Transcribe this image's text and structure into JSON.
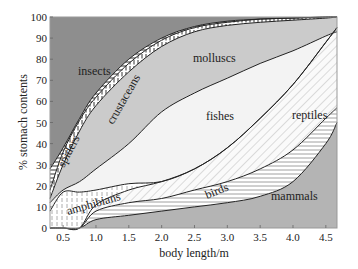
{
  "chart_data": {
    "type": "area",
    "title": "",
    "xlabel": "body length/m",
    "ylabel": "% stomach contents",
    "xlim": [
      0.3,
      4.67
    ],
    "ylim": [
      0,
      100
    ],
    "x_ticks": [
      "0.5",
      "1.0",
      "1.5",
      "2.0",
      "2.5",
      "3.0",
      "3.5",
      "4.0",
      "4.5"
    ],
    "y_ticks": [
      "0",
      "10",
      "20",
      "30",
      "40",
      "50",
      "60",
      "70",
      "80",
      "90",
      "100"
    ],
    "grid": false,
    "legend": "inline region labels",
    "x": [
      0.3,
      0.5,
      0.75,
      1.0,
      1.5,
      2.0,
      2.5,
      3.0,
      3.5,
      4.0,
      4.5,
      4.67
    ],
    "cumulative_boundaries": [
      {
        "name": "mammals",
        "upper": [
          0,
          0,
          0,
          4,
          6,
          8,
          10,
          12,
          15,
          22,
          40,
          50
        ]
      },
      {
        "name": "birds",
        "upper": [
          0,
          0,
          0,
          8,
          12,
          14,
          18,
          22,
          28,
          37,
          52,
          57
        ]
      },
      {
        "name": "reptiles",
        "upper": [
          0,
          0,
          0,
          11,
          18,
          22,
          28,
          38,
          52,
          68,
          88,
          95
        ]
      },
      {
        "name": "amphibians",
        "upper": [
          8,
          17,
          17,
          18,
          21,
          22,
          28,
          38,
          52,
          68,
          88,
          95
        ]
      },
      {
        "name": "fishes",
        "upper": [
          12,
          18,
          22,
          28,
          40,
          55,
          64,
          71,
          78,
          84,
          91,
          93
        ]
      },
      {
        "name": "molluscs",
        "upper": [
          14,
          30,
          46,
          58,
          74,
          86,
          93,
          96,
          97.5,
          98.5,
          99.5,
          100
        ]
      },
      {
        "name": "crustaceans",
        "upper": [
          18,
          36,
          51,
          62,
          78,
          89,
          95,
          97.5,
          99,
          99.5,
          100,
          100
        ]
      },
      {
        "name": "spiders",
        "upper": [
          28,
          38,
          52,
          64,
          80,
          90,
          95.5,
          98,
          99,
          99.5,
          100,
          100
        ]
      },
      {
        "name": "insects",
        "upper": [
          100,
          100,
          100,
          100,
          100,
          100,
          100,
          100,
          100,
          100,
          100,
          100
        ]
      }
    ],
    "series": [
      {
        "name": "insects",
        "fill": "#8f8f8f",
        "pattern": "solid dark grey"
      },
      {
        "name": "spiders",
        "fill": "#ffffff",
        "pattern": "horizontal lines"
      },
      {
        "name": "crustaceans",
        "fill": "#ffffff",
        "pattern": "vertical dashes"
      },
      {
        "name": "molluscs",
        "fill": "#c8c8c8",
        "pattern": "solid light grey"
      },
      {
        "name": "fishes",
        "fill": "#f2f2f2",
        "pattern": "solid very light"
      },
      {
        "name": "reptiles",
        "fill": "#ffffff",
        "pattern": "diagonal lines"
      },
      {
        "name": "amphibians",
        "fill": "#ffffff",
        "pattern": "vertical dashes"
      },
      {
        "name": "birds",
        "fill": "#ffffff",
        "pattern": "horizontal lines"
      },
      {
        "name": "mammals",
        "fill": "#b4b4b4",
        "pattern": "solid mid grey"
      }
    ],
    "labels": {
      "insects": "insects",
      "spiders": "spiders",
      "crustaceans": "crustaceans",
      "molluscs": "molluscs",
      "fishes": "fishes",
      "reptiles": "reptiles",
      "amphibians": "amphibians",
      "birds": "birds",
      "mammals": "mammals"
    }
  }
}
